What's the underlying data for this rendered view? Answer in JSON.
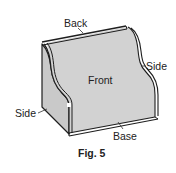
{
  "figure": {
    "caption": "Fig. 5",
    "labels": {
      "back": "Back",
      "front": "Front",
      "side_right": "Side",
      "side_left": "Side",
      "base": "Base"
    },
    "colors": {
      "face_fill": "#d2d2d2",
      "side_fill": "#c9c9c9",
      "outline": "#1e1e1e",
      "text": "#222222",
      "background": "#ffffff"
    }
  }
}
